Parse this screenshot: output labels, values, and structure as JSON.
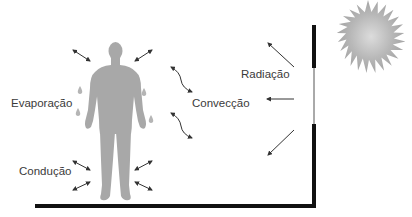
{
  "labels": {
    "evaporation": "Evaporação",
    "conduction": "Condução",
    "convection": "Convecção",
    "radiation": "Radiação"
  },
  "elements": {
    "sun": "sun-icon",
    "human": "human-figure",
    "wall": "wall-with-window",
    "floor": "floor-line"
  },
  "colors": {
    "figure": "#a8a8a8",
    "sun": "#b0b0b0",
    "sun_center": "#d8d8d8",
    "wall": "#111111",
    "arrow": "#333333",
    "text": "#3a3a3a"
  }
}
